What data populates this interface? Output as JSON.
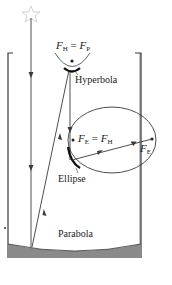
{
  "diagram": {
    "labels": {
      "hyperbola_focus": {
        "f1": "F",
        "f1_sub": "H",
        "eq": " = ",
        "f2": "F",
        "f2_sub": "P"
      },
      "hyperbola": "Hyperbola",
      "ellipse_focus": {
        "f1": "F",
        "f1_sub": "E",
        "eq": " = ",
        "f2": "F",
        "f2_sub": "H"
      },
      "ellipse_focus_right": {
        "f": "F",
        "f_sub": "E"
      },
      "ellipse": "Ellipse",
      "parabola": "Parabola"
    },
    "icons": {
      "star": "star-icon"
    },
    "colors": {
      "line": "#3a3a3a",
      "mirror_fill": "#8a8a8a",
      "star_outline": "#c8c8c8",
      "background": "#ffffff"
    }
  }
}
